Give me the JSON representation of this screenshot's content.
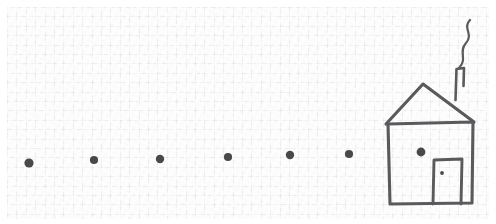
{
  "image": {
    "title": "Hand-drawn sketch of a dotted path leading to a house",
    "width": 496,
    "height": 224,
    "medium": "pencil on graph paper"
  },
  "colors": {
    "paper": "#fbfbfb",
    "page_border": "#ffffff",
    "grid_line": "#9ba0a6",
    "ink": "#5a5a5c",
    "ink_dark": "#4a4a4a"
  },
  "scene": {
    "path": {
      "label": "dotted path",
      "dot_count": 6,
      "dot_radius": 4.2,
      "dots": [
        {
          "cx": 29,
          "cy": 163,
          "r": 4.6
        },
        {
          "cx": 94,
          "cy": 160,
          "r": 4.1
        },
        {
          "cx": 160,
          "cy": 159,
          "r": 4.2
        },
        {
          "cx": 228,
          "cy": 157,
          "r": 4.1
        },
        {
          "cx": 290,
          "cy": 155,
          "r": 4.2
        },
        {
          "cx": 349,
          "cy": 154,
          "r": 4.1
        }
      ]
    },
    "house": {
      "label": "house",
      "body": {
        "left": 389,
        "right": 472,
        "top": 123,
        "bottom": 203
      },
      "roof": {
        "peak_x": 423,
        "peak_y": 84,
        "left_eave_x": 386,
        "left_eave_y": 124,
        "right_eave_x": 474,
        "right_eave_y": 122
      },
      "chimney": {
        "left": 454,
        "right": 463,
        "top": 68,
        "bottom_y": 100
      },
      "smoke": {
        "label": "wavy smoke",
        "tip_x": 470,
        "tip_y": 20,
        "base_x": 459,
        "base_y": 68
      },
      "window": {
        "cx": 421,
        "cy": 152,
        "r": 4.4
      },
      "door": {
        "left": 433,
        "right": 462,
        "top": 160,
        "bottom": 203
      },
      "doorknob": {
        "cx": 442,
        "cy": 173,
        "r": 1.9
      }
    }
  }
}
